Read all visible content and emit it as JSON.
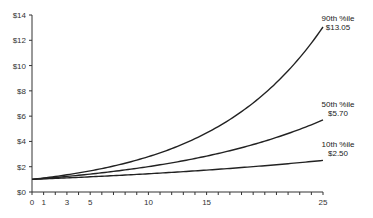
{
  "chart_data": {
    "type": "line",
    "title": "",
    "xlabel": "",
    "ylabel": "",
    "xlim": [
      0,
      25
    ],
    "ylim": [
      0,
      14
    ],
    "grid": false,
    "legend": "direct labels at right end of lines",
    "x_ticks": [
      0,
      1,
      2,
      3,
      4,
      5,
      6,
      7,
      8,
      9,
      10,
      11,
      12,
      13,
      14,
      15,
      16,
      17,
      18,
      19,
      20,
      21,
      22,
      23,
      24,
      25
    ],
    "x_tick_labels": [
      {
        "x": 0,
        "label": "0"
      },
      {
        "x": 1,
        "label": "1"
      },
      {
        "x": 3,
        "label": "3"
      },
      {
        "x": 5,
        "label": "5"
      },
      {
        "x": 10,
        "label": "10"
      },
      {
        "x": 15,
        "label": "15"
      },
      {
        "x": 25,
        "label": "25"
      }
    ],
    "y_ticks": [
      {
        "y": 0,
        "label": "$0"
      },
      {
        "y": 2,
        "label": "$2"
      },
      {
        "y": 4,
        "label": "$4"
      },
      {
        "y": 6,
        "label": "$6"
      },
      {
        "y": 8,
        "label": "$8"
      },
      {
        "y": 10,
        "label": "$10"
      },
      {
        "y": 12,
        "label": "$12"
      },
      {
        "y": 14,
        "label": "$14"
      }
    ],
    "x": [
      0,
      1,
      3,
      5,
      10,
      15,
      20,
      25
    ],
    "series": [
      {
        "name": "90th %ile",
        "end_label": "$13.05",
        "values": [
          1.0,
          1.11,
          1.36,
          1.67,
          2.79,
          4.67,
          7.8,
          13.05
        ]
      },
      {
        "name": "50th %ile",
        "end_label": "$5.70",
        "values": [
          1.0,
          1.07,
          1.23,
          1.42,
          2.0,
          2.84,
          4.02,
          5.7
        ]
      },
      {
        "name": "10th %ile",
        "end_label": "$2.50",
        "values": [
          1.0,
          1.04,
          1.12,
          1.2,
          1.44,
          1.73,
          2.08,
          2.5
        ]
      }
    ],
    "colors": {
      "line": "#222222",
      "axis": "#333333",
      "text": "#333333"
    }
  }
}
